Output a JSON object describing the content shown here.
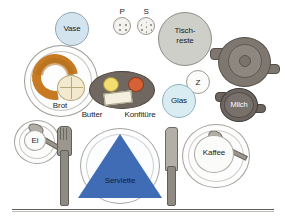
{
  "scene": {
    "title": "Gedeckter Fruehstueckstisch",
    "background_color": "#ffffff",
    "table_edge_color": "#5f5e5a"
  },
  "labels": {
    "vase": "Vase",
    "pepper": "P",
    "salt": "S",
    "tischreste_line1": "Tisch-",
    "tischreste_line2": "reste",
    "zucker": "Z",
    "milch": "Milch",
    "brot": "Brot",
    "butter": "Butter",
    "konfiture": "Konfitüre",
    "glas": "Glas",
    "ei": "Ei",
    "serviette": "Serviette",
    "kaffee": "Kaffee"
  },
  "colors": {
    "vase": "#d4e4ef",
    "glas": "#d9ecf2",
    "napkin": "#3f6cb4",
    "croissant": "#c77a21",
    "roll": "#f2e9cf",
    "butter_dot": "#f2dd6e",
    "jam_dot": "#d46236",
    "tray": "#6f6760",
    "teapot": "#7e776f",
    "milch": "#6d6560",
    "tischreste": "#cfcfca",
    "cutlery": "#8f8b83",
    "plate": "#fdfdfd"
  },
  "objects": [
    {
      "name": "vase",
      "label": "Vase",
      "shape": "circle"
    },
    {
      "name": "pepper-shaker",
      "label": "P",
      "shape": "circle",
      "holes": 4
    },
    {
      "name": "salt-shaker",
      "label": "S",
      "shape": "circle",
      "holes": 7
    },
    {
      "name": "leftovers-bowl",
      "label": "Tisch-reste",
      "shape": "circle"
    },
    {
      "name": "teapot",
      "label": "",
      "shape": "circle-with-spout"
    },
    {
      "name": "sugar-bowl",
      "label": "Z",
      "shape": "circle"
    },
    {
      "name": "milk-jug",
      "label": "Milch",
      "shape": "circle-with-spout"
    },
    {
      "name": "bread-plate",
      "label": "Brot",
      "shape": "circle",
      "contents": [
        "croissant",
        "roll"
      ]
    },
    {
      "name": "condiment-tray",
      "label": "Butter / Konfitüre",
      "shape": "ellipse",
      "contents": [
        "butter",
        "jam",
        "butter-pat"
      ]
    },
    {
      "name": "glass",
      "label": "Glas",
      "shape": "circle"
    },
    {
      "name": "egg-cup",
      "label": "Ei",
      "shape": "circle",
      "contents": [
        "teaspoon"
      ]
    },
    {
      "name": "fork",
      "label": "",
      "shape": "utensil"
    },
    {
      "name": "dinner-plate",
      "label": "Serviette",
      "shape": "circle",
      "contents": [
        "napkin-triangle"
      ]
    },
    {
      "name": "knife",
      "label": "",
      "shape": "utensil"
    },
    {
      "name": "coffee-cup",
      "label": "Kaffee",
      "shape": "circle",
      "contents": [
        "teaspoon"
      ]
    }
  ]
}
